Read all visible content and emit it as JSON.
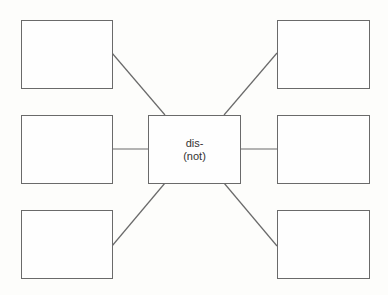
{
  "diagram": {
    "type": "word-web",
    "center": {
      "line1": "dis-",
      "line2": "(not)"
    },
    "satellites": [
      {
        "id": "top-left",
        "text": ""
      },
      {
        "id": "middle-left",
        "text": ""
      },
      {
        "id": "bottom-left",
        "text": ""
      },
      {
        "id": "top-right",
        "text": ""
      },
      {
        "id": "middle-right",
        "text": ""
      },
      {
        "id": "bottom-right",
        "text": ""
      }
    ],
    "colors": {
      "stroke": "#6a6a6a",
      "background": "#fdfdfb",
      "text": "#333333"
    }
  }
}
